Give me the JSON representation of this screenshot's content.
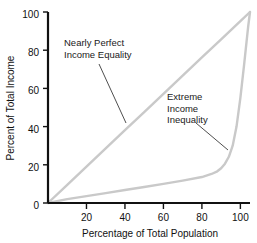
{
  "chart_data": {
    "type": "line",
    "title": "",
    "xlabel": "Percentage of Total Population",
    "ylabel": "Percent of Total Income",
    "xlim": [
      0,
      105
    ],
    "ylim": [
      0,
      100
    ],
    "xticks": [
      20,
      40,
      60,
      80,
      100
    ],
    "yticks": [
      0,
      20,
      40,
      60,
      80,
      100
    ],
    "xticklabels": [
      "20",
      "40",
      "60",
      "80",
      "100"
    ],
    "yticklabels": [
      "0",
      "20",
      "40",
      "60",
      "80",
      "100"
    ],
    "grid": false,
    "legend": "none",
    "line_color": "#c9c9c9",
    "axis_color": "#111111",
    "background": "#ffffff",
    "series": [
      {
        "name": "Nearly Perfect Income Equality",
        "description": "line of perfect equality, straight diagonal from origin to top right",
        "x": [
          0,
          10,
          20,
          30,
          40,
          50,
          60,
          70,
          80,
          90,
          100,
          105
        ],
        "y": [
          0,
          9.5,
          19,
          28.6,
          38.1,
          47.6,
          57.1,
          66.7,
          76.2,
          85.7,
          95.2,
          100
        ]
      },
      {
        "name": "Extreme Income Inequality",
        "description": "Lorenz curve, nearly flat to 80% of population then rising steeply",
        "x": [
          0,
          10,
          20,
          30,
          40,
          50,
          60,
          70,
          80,
          85,
          88,
          90,
          92,
          94,
          96,
          98,
          100,
          102,
          104,
          105
        ],
        "y": [
          0,
          2.0,
          3.6,
          5.2,
          6.8,
          8.4,
          10.0,
          11.7,
          13.6,
          15.2,
          16.6,
          18.2,
          20.6,
          24.2,
          30.0,
          40.0,
          55.0,
          73.0,
          92.0,
          100
        ]
      }
    ],
    "annotations": [
      {
        "id": "equality-label",
        "lines": [
          "Nearly Perfect",
          "Income Equality"
        ],
        "text_x": 64,
        "text_y": 46,
        "leader_from_x": 99,
        "leader_from_y": 64,
        "leader_to_x": 126,
        "leader_to_y": 123
      },
      {
        "id": "inequality-label",
        "lines": [
          "Extreme",
          "Income",
          "Inequality"
        ],
        "text_x": 167,
        "text_y": 100,
        "leader_from_x": 196,
        "leader_from_y": 123,
        "leader_to_x": 228,
        "leader_to_y": 150
      }
    ]
  }
}
